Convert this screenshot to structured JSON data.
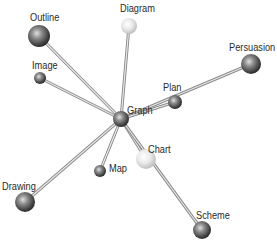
{
  "diagram": {
    "type": "network",
    "center": {
      "id": "graph",
      "label": "Graph",
      "x": 121,
      "y": 119,
      "r": 8,
      "shade": "dark",
      "label_x": 127,
      "label_y": 104
    },
    "nodes": [
      {
        "id": "outline",
        "label": "Outline",
        "x": 39,
        "y": 36,
        "r": 11,
        "shade": "dark",
        "label_x": 30,
        "label_y": 11
      },
      {
        "id": "diagram",
        "label": "Diagram",
        "x": 129,
        "y": 26,
        "r": 8,
        "shade": "light",
        "label_x": 120,
        "label_y": 2
      },
      {
        "id": "persuasion",
        "label": "Persuasion",
        "x": 251,
        "y": 64,
        "r": 10,
        "shade": "dark",
        "label_x": 229,
        "label_y": 41
      },
      {
        "id": "image",
        "label": "Image",
        "x": 40,
        "y": 78,
        "r": 6,
        "shade": "dark",
        "label_x": 32,
        "label_y": 59
      },
      {
        "id": "plan",
        "label": "Plan",
        "x": 175,
        "y": 102,
        "r": 7,
        "shade": "dark",
        "label_x": 163,
        "label_y": 81
      },
      {
        "id": "chart",
        "label": "Chart",
        "x": 146,
        "y": 159,
        "r": 10,
        "shade": "light",
        "label_x": 148,
        "label_y": 143
      },
      {
        "id": "map",
        "label": "Map",
        "x": 100,
        "y": 171,
        "r": 6,
        "shade": "dark",
        "label_x": 109,
        "label_y": 162
      },
      {
        "id": "drawing",
        "label": "Drawing",
        "x": 25,
        "y": 202,
        "r": 10,
        "shade": "dark",
        "label_x": 2,
        "label_y": 180
      },
      {
        "id": "scheme",
        "label": "Scheme",
        "x": 202,
        "y": 230,
        "r": 9,
        "shade": "dark",
        "label_x": 196,
        "label_y": 209
      }
    ],
    "edges": [
      {
        "from": "graph",
        "to": "outline"
      },
      {
        "from": "graph",
        "to": "diagram"
      },
      {
        "from": "graph",
        "to": "persuasion"
      },
      {
        "from": "graph",
        "to": "image"
      },
      {
        "from": "graph",
        "to": "plan"
      },
      {
        "from": "graph",
        "to": "chart"
      },
      {
        "from": "graph",
        "to": "map"
      },
      {
        "from": "graph",
        "to": "drawing"
      },
      {
        "from": "graph",
        "to": "scheme"
      }
    ],
    "colors": {
      "background": "#ffffff",
      "edge": "#8a8a8a",
      "edge_highlight": "#e8e8e8",
      "dark_ball_light": "#d8d8d8",
      "dark_ball_mid": "#7a7a7a",
      "dark_ball_dark": "#2e2e2e",
      "light_ball_light": "#ffffff",
      "light_ball_mid": "#e6e6e6",
      "light_ball_dark": "#bdbdbd",
      "label": "#2a2a2a"
    }
  }
}
